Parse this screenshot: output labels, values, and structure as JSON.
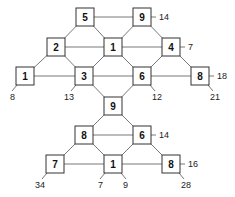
{
  "diagram": {
    "type": "graph",
    "nodes": [
      {
        "id": "n5",
        "label": "5",
        "x": 85,
        "y": 17
      },
      {
        "id": "n9a",
        "label": "9",
        "x": 142,
        "y": 17
      },
      {
        "id": "n2",
        "label": "2",
        "x": 56,
        "y": 47
      },
      {
        "id": "n1a",
        "label": "1",
        "x": 113,
        "y": 47
      },
      {
        "id": "n4",
        "label": "4",
        "x": 171,
        "y": 47
      },
      {
        "id": "n1b",
        "label": "1",
        "x": 25,
        "y": 76
      },
      {
        "id": "n3",
        "label": "3",
        "x": 84,
        "y": 76
      },
      {
        "id": "n6a",
        "label": "6",
        "x": 142,
        "y": 76
      },
      {
        "id": "n8a",
        "label": "8",
        "x": 200,
        "y": 76
      },
      {
        "id": "n9b",
        "label": "9",
        "x": 113,
        "y": 106
      },
      {
        "id": "n8b",
        "label": "8",
        "x": 84,
        "y": 135
      },
      {
        "id": "n6b",
        "label": "6",
        "x": 142,
        "y": 135
      },
      {
        "id": "n7",
        "label": "7",
        "x": 55,
        "y": 164
      },
      {
        "id": "n1c",
        "label": "1",
        "x": 113,
        "y": 164
      },
      {
        "id": "n8c",
        "label": "8",
        "x": 171,
        "y": 164
      }
    ],
    "edges": [
      [
        "n5",
        "n9a"
      ],
      [
        "n5",
        "n2"
      ],
      [
        "n5",
        "n1a"
      ],
      [
        "n9a",
        "n1a"
      ],
      [
        "n9a",
        "n4"
      ],
      [
        "n2",
        "n1a"
      ],
      [
        "n1a",
        "n4"
      ],
      [
        "n2",
        "n1b"
      ],
      [
        "n2",
        "n3"
      ],
      [
        "n1a",
        "n3"
      ],
      [
        "n1a",
        "n6a"
      ],
      [
        "n4",
        "n6a"
      ],
      [
        "n4",
        "n8a"
      ],
      [
        "n1b",
        "n3"
      ],
      [
        "n3",
        "n6a"
      ],
      [
        "n6a",
        "n8a"
      ],
      [
        "n3",
        "n9b"
      ],
      [
        "n6a",
        "n9b"
      ],
      [
        "n9b",
        "n8b"
      ],
      [
        "n9b",
        "n6b"
      ],
      [
        "n8b",
        "n6b"
      ],
      [
        "n8b",
        "n7"
      ],
      [
        "n8b",
        "n1c"
      ],
      [
        "n6b",
        "n1c"
      ],
      [
        "n6b",
        "n8c"
      ],
      [
        "n7",
        "n1c"
      ],
      [
        "n1c",
        "n8c"
      ]
    ],
    "annotations": [
      {
        "node": "n9a",
        "text": "14",
        "side": "right"
      },
      {
        "node": "n4",
        "text": "7",
        "side": "right"
      },
      {
        "node": "n8a",
        "text": "18",
        "side": "right"
      },
      {
        "node": "n8a",
        "text": "21",
        "side": "below-right"
      },
      {
        "node": "n1b",
        "text": "8",
        "side": "below-left"
      },
      {
        "node": "n3",
        "text": "13",
        "side": "below-left"
      },
      {
        "node": "n6a",
        "text": "12",
        "side": "below-right"
      },
      {
        "node": "n6b",
        "text": "14",
        "side": "right"
      },
      {
        "node": "n8c",
        "text": "16",
        "side": "right"
      },
      {
        "node": "n8c",
        "text": "28",
        "side": "below-right"
      },
      {
        "node": "n7",
        "text": "34",
        "side": "below-left"
      },
      {
        "node": "n1c",
        "text": "7",
        "side": "below-left"
      },
      {
        "node": "n1c",
        "text": "9",
        "side": "below-right"
      }
    ]
  }
}
